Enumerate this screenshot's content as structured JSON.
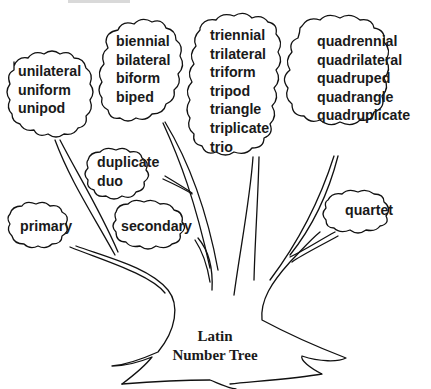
{
  "diagram": {
    "title_line1": "Latin",
    "title_line2": "Number Tree",
    "stroke_color": "#111111",
    "background": "#ffffff",
    "clouds": [
      {
        "id": "uni",
        "words": [
          "unilateral",
          "uniform",
          "unipod"
        ]
      },
      {
        "id": "bi",
        "words": [
          "biennial",
          "bilateral",
          "biform",
          "biped"
        ]
      },
      {
        "id": "tri",
        "words": [
          "triennial",
          "trilateral",
          "triform",
          "tripod",
          "triangle",
          "triplicate",
          "trio"
        ]
      },
      {
        "id": "quad",
        "words": [
          "quadrennial",
          "quadrilateral",
          "quadruped",
          "quadrangle",
          "quadruplicate"
        ]
      },
      {
        "id": "du",
        "words": [
          "duplicate",
          "duo"
        ]
      },
      {
        "id": "primary",
        "words": [
          "primary"
        ]
      },
      {
        "id": "secondary",
        "words": [
          "secondary"
        ]
      },
      {
        "id": "quartet",
        "words": [
          "quartet"
        ]
      }
    ]
  }
}
